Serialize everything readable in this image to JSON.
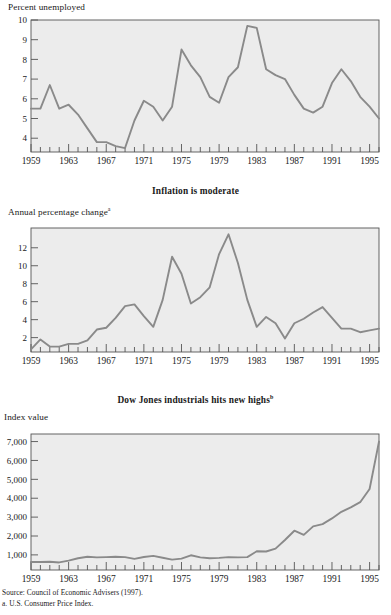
{
  "figure": {
    "source_line": "Source: Council of Economic Advisers (1997).",
    "footnote_a": "a. U.S. Consumer Price Index."
  },
  "charts": [
    {
      "id": "unemployment",
      "title": "",
      "ylabel": "Percent unemployed",
      "ylabel_sup": "",
      "title_sup": "",
      "chart_data": {
        "type": "line",
        "title": "",
        "xlabel": "",
        "ylabel": "Percent unemployed",
        "xlim": [
          1959,
          1996
        ],
        "ylim": [
          3.3,
          10
        ],
        "yticks": [
          4,
          5,
          6,
          7,
          8,
          9,
          10
        ],
        "ytick_labels": [
          "4",
          "5",
          "6",
          "7",
          "8",
          "9",
          "10"
        ],
        "xticks": [
          1959,
          1963,
          1967,
          1971,
          1975,
          1979,
          1983,
          1987,
          1991,
          1995
        ],
        "xtick_labels": [
          "1959",
          "1963",
          "1967",
          "1971",
          "1975",
          "1979",
          "1983",
          "1987",
          "1991",
          "1995"
        ],
        "minor_xticks": "every year 1959-1996",
        "grid": false,
        "legend": "none",
        "line_color": "#8a8a8a",
        "plot_bg": "#ececec",
        "x": [
          1959,
          1960,
          1961,
          1962,
          1963,
          1964,
          1965,
          1966,
          1967,
          1968,
          1969,
          1970,
          1971,
          1972,
          1973,
          1974,
          1975,
          1976,
          1977,
          1978,
          1979,
          1980,
          1981,
          1982,
          1983,
          1984,
          1985,
          1986,
          1987,
          1988,
          1989,
          1990,
          1991,
          1992,
          1993,
          1994,
          1995,
          1996
        ],
        "values": [
          5.5,
          5.5,
          6.7,
          5.5,
          5.7,
          5.2,
          4.5,
          3.8,
          3.8,
          3.6,
          3.5,
          4.9,
          5.9,
          5.6,
          4.9,
          5.6,
          8.5,
          7.7,
          7.1,
          6.1,
          5.8,
          7.1,
          7.6,
          9.7,
          9.6,
          7.5,
          7.2,
          7.0,
          6.2,
          5.5,
          5.3,
          5.6,
          6.8,
          7.5,
          6.9,
          6.1,
          5.6,
          5.0
        ]
      }
    },
    {
      "id": "inflation",
      "title": "Inflation is moderate",
      "title_sup": "",
      "ylabel": "Annual percentage change",
      "ylabel_sup": "a",
      "chart_data": {
        "type": "line",
        "title": "Inflation is moderate",
        "xlabel": "",
        "ylabel": "Annual percentage change",
        "xlim": [
          1959,
          1996
        ],
        "ylim": [
          0.4,
          14.2
        ],
        "yticks": [
          2,
          4,
          6,
          8,
          10,
          12
        ],
        "ytick_labels": [
          "2",
          "4",
          "6",
          "8",
          "10",
          "12"
        ],
        "xticks": [
          1959,
          1963,
          1967,
          1971,
          1975,
          1979,
          1983,
          1987,
          1991,
          1995
        ],
        "xtick_labels": [
          "1959",
          "1963",
          "1967",
          "1971",
          "1975",
          "1979",
          "1983",
          "1987",
          "1991",
          "1995"
        ],
        "minor_xticks": "every year 1959-1996",
        "grid": false,
        "legend": "none",
        "line_color": "#8a8a8a",
        "plot_bg": "#ececec",
        "x": [
          1959,
          1960,
          1961,
          1962,
          1963,
          1964,
          1965,
          1966,
          1967,
          1968,
          1969,
          1970,
          1971,
          1972,
          1973,
          1974,
          1975,
          1976,
          1977,
          1978,
          1979,
          1980,
          1981,
          1982,
          1983,
          1984,
          1985,
          1986,
          1987,
          1988,
          1989,
          1990,
          1991,
          1992,
          1993,
          1994,
          1995,
          1996
        ],
        "values": [
          0.7,
          1.8,
          1.0,
          1.0,
          1.3,
          1.3,
          1.7,
          2.9,
          3.1,
          4.2,
          5.5,
          5.7,
          4.4,
          3.2,
          6.2,
          11.0,
          9.1,
          5.8,
          6.5,
          7.6,
          11.3,
          13.5,
          10.3,
          6.2,
          3.2,
          4.3,
          3.6,
          1.9,
          3.6,
          4.1,
          4.8,
          5.4,
          4.2,
          3.0,
          3.0,
          2.6,
          2.8,
          3.0
        ]
      }
    },
    {
      "id": "dow-jones",
      "title": "Dow Jones industrials hits new highs",
      "title_sup": "b",
      "ylabel": "Index value",
      "ylabel_sup": "",
      "chart_data": {
        "type": "line",
        "title": "Dow Jones industrials hits new highs",
        "xlabel": "",
        "ylabel": "Index value",
        "xlim": [
          1959,
          1996
        ],
        "ylim": [
          200,
          7400
        ],
        "yticks": [
          1000,
          2000,
          3000,
          4000,
          5000,
          6000,
          7000
        ],
        "ytick_labels": [
          "1,000",
          "2,000",
          "3,000",
          "4,000",
          "5,000",
          "6,000",
          "7,000"
        ],
        "xticks": [
          1959,
          1963,
          1967,
          1971,
          1975,
          1979,
          1983,
          1987,
          1991,
          1995
        ],
        "xtick_labels": [
          "1959",
          "1963",
          "1967",
          "1971",
          "1975",
          "1979",
          "1983",
          "1987",
          "1991",
          "1995"
        ],
        "minor_xticks": "every year 1959-1996",
        "grid": false,
        "legend": "none",
        "line_color": "#8a8a8a",
        "plot_bg": "#ececec",
        "x": [
          1959,
          1960,
          1961,
          1962,
          1963,
          1964,
          1965,
          1966,
          1967,
          1968,
          1969,
          1970,
          1971,
          1972,
          1973,
          1974,
          1975,
          1976,
          1977,
          1978,
          1979,
          1980,
          1981,
          1982,
          1983,
          1984,
          1985,
          1986,
          1987,
          1988,
          1989,
          1990,
          1991,
          1992,
          1993,
          1994,
          1995,
          1996
        ],
        "values": [
          620,
          620,
          640,
          600,
          700,
          820,
          900,
          870,
          880,
          900,
          880,
          790,
          890,
          950,
          850,
          750,
          800,
          980,
          870,
          820,
          840,
          880,
          870,
          880,
          1190,
          1180,
          1330,
          1790,
          2280,
          2060,
          2510,
          2630,
          2930,
          3280,
          3520,
          3790,
          4490,
          7000
        ]
      }
    }
  ]
}
